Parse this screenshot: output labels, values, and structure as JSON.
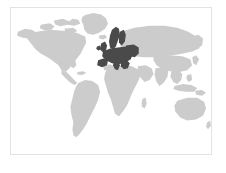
{
  "figure": {
    "kind": "world-map-thumbnail",
    "title": "",
    "caption": "",
    "width_px": 226,
    "height_px": 173
  },
  "frame": {
    "border_color": "#e3e3e3",
    "background_color": "#ffffff",
    "x": 10,
    "y": 7,
    "width": 202,
    "height": 148
  },
  "map": {
    "projection_note": "equirectangular",
    "ocean_color": "#ffffff",
    "land_color": "#cccccc",
    "highlight_color": "#4a4a4a",
    "legend_visible": false,
    "labels_visible": false,
    "graticule_visible": false
  },
  "regions": {
    "highlighted_label": "Europe",
    "highlighted_members": [
      "Norway",
      "Sweden",
      "Finland",
      "Denmark",
      "United Kingdom",
      "Ireland",
      "France",
      "Spain",
      "Portugal",
      "Germany",
      "Poland",
      "Italy",
      "Austria",
      "Switzerland",
      "Netherlands",
      "Belgium",
      "Czechia",
      "Slovakia",
      "Hungary",
      "Romania",
      "Bulgaria",
      "Greece",
      "Balkans",
      "Baltic States"
    ],
    "unhighlighted_label": "Rest of world",
    "unhighlighted_members": [
      "North America",
      "South America",
      "Africa",
      "Asia",
      "Australia",
      "Greenland"
    ]
  }
}
